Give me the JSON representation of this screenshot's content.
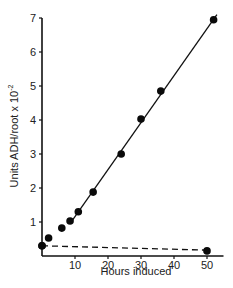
{
  "chart_data": {
    "type": "scatter",
    "title": "",
    "xlabel": "Hours induced",
    "ylabel": "Units ADH/root x 10",
    "ylabel_superscript": "-2",
    "xlim": [
      0,
      55
    ],
    "ylim": [
      0,
      7
    ],
    "xticks": [
      10,
      20,
      30,
      40,
      50
    ],
    "yticks": [
      1,
      2,
      3,
      4,
      5,
      6,
      7
    ],
    "grid": false,
    "legend": null,
    "series": [
      {
        "name": "induced",
        "marker": "filled-circle",
        "x": [
          0,
          2,
          6,
          8.5,
          11,
          15.5,
          24,
          30,
          36,
          52
        ],
        "y": [
          0.3,
          0.53,
          0.82,
          1.03,
          1.3,
          1.88,
          3.0,
          4.03,
          4.85,
          6.95
        ]
      },
      {
        "name": "control",
        "marker": "filled-circle",
        "x": [
          0,
          50
        ],
        "y": [
          0.3,
          0.15
        ]
      }
    ],
    "lines": [
      {
        "name": "regression-fit",
        "style": "solid",
        "x": [
          8.5,
          53
        ],
        "y": [
          0.95,
          7.1
        ]
      },
      {
        "name": "control-trend",
        "style": "dashed",
        "x": [
          0,
          51
        ],
        "y": [
          0.3,
          0.17
        ]
      }
    ]
  }
}
